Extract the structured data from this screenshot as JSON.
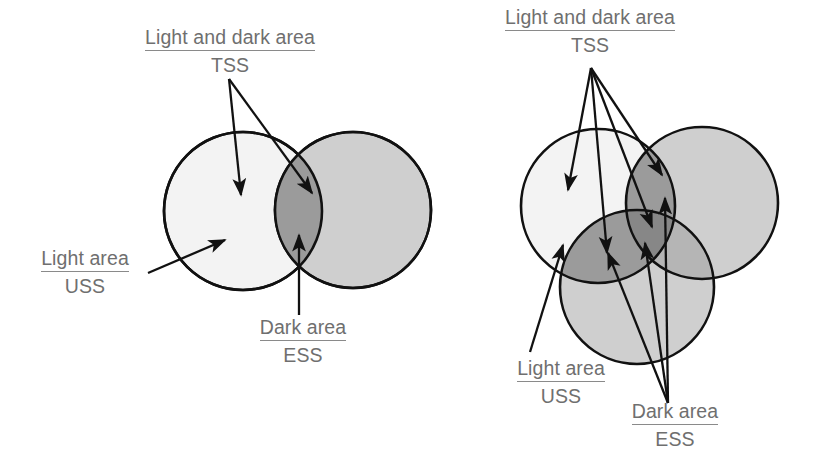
{
  "figure": {
    "background_color": "#ffffff",
    "text_color": "#6f6f6f",
    "outline_color": "#1a1a1a",
    "fill_light": "#f2f2f2",
    "fill_medium": "#cfcfcf",
    "fill_dark": "#9b9b9b",
    "fill_darkest": "#8a8a8a"
  },
  "diagrams": [
    {
      "id": "two-circle-diagram",
      "name": "two-set-venn",
      "circle_count": 2,
      "circles": [
        {
          "name": "light-circle",
          "cx": 243,
          "cy": 211,
          "r": 79,
          "shade": "light"
        },
        {
          "name": "medium-circle",
          "cx": 353,
          "cy": 210,
          "r": 78,
          "shade": "medium"
        }
      ],
      "labels": [
        {
          "name": "label-tss",
          "line1": "Light and dark area",
          "line2": "TSS",
          "underline_line1": true,
          "arrow_count": 2
        },
        {
          "name": "label-uss",
          "line1": "Light area",
          "line2": "USS",
          "underline_line1": true,
          "arrow_count": 1
        },
        {
          "name": "label-ess",
          "line1": "Dark area",
          "line2": "ESS",
          "underline_line1": true,
          "arrow_count": 1
        }
      ]
    },
    {
      "id": "three-circle-diagram",
      "name": "three-set-venn",
      "circle_count": 3,
      "circles": [
        {
          "name": "light-circle",
          "cx": 598,
          "cy": 206,
          "r": 77,
          "shade": "light"
        },
        {
          "name": "medium-circle-right",
          "cx": 702,
          "cy": 203,
          "r": 76,
          "shade": "medium"
        },
        {
          "name": "medium-circle-bottom",
          "cx": 637,
          "cy": 287,
          "r": 77,
          "shade": "medium"
        }
      ],
      "labels": [
        {
          "name": "label-tss",
          "line1": "Light and dark area",
          "line2": "TSS",
          "underline_line1": true,
          "arrow_count": 4
        },
        {
          "name": "label-uss",
          "line1": "Light area",
          "line2": "USS",
          "underline_line1": true,
          "arrow_count": 1
        },
        {
          "name": "label-ess",
          "line1": "Dark area",
          "line2": "ESS",
          "underline_line1": true,
          "arrow_count": 3
        }
      ]
    }
  ],
  "legend_terms": {
    "uss": "USS",
    "ess": "ESS",
    "tss": "TSS",
    "light_area": "Light area",
    "dark_area": "Dark area",
    "light_and_dark_area": "Light and dark area"
  }
}
